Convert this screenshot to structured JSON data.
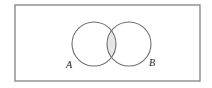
{
  "figure": {
    "name": "venn-diagram-intersection",
    "universal_set_box": {
      "name": "universal-set-rectangle",
      "x": 15,
      "y": 5,
      "width": 185,
      "height": 76,
      "stroke": "#8a8a8a",
      "fill": "#ffffff",
      "stroke_width": 1.4
    },
    "circles": [
      {
        "name": "circle-a",
        "label": "A",
        "cx": 94,
        "cy": 44,
        "r": 22,
        "stroke": "#6e6e6e",
        "fill": "none"
      },
      {
        "name": "circle-b",
        "label": "B",
        "cx": 129,
        "cy": 44,
        "r": 22,
        "stroke": "#6e6e6e",
        "fill": "none"
      }
    ],
    "intersection": {
      "name": "intersection-region",
      "shaded": true,
      "fill": "#e6e6e6",
      "stroke": "#8f8f8f"
    },
    "labels": [
      {
        "name": "label-a",
        "text": "A",
        "x": 69,
        "y": 68
      },
      {
        "name": "label-b",
        "text": "B",
        "x": 152,
        "y": 66
      }
    ],
    "colors": {
      "border": "#8a8a8a",
      "circle_stroke": "#6e6e6e",
      "shade": "#e6e6e6",
      "text": "#1a1a1a",
      "background": "#ffffff"
    }
  }
}
